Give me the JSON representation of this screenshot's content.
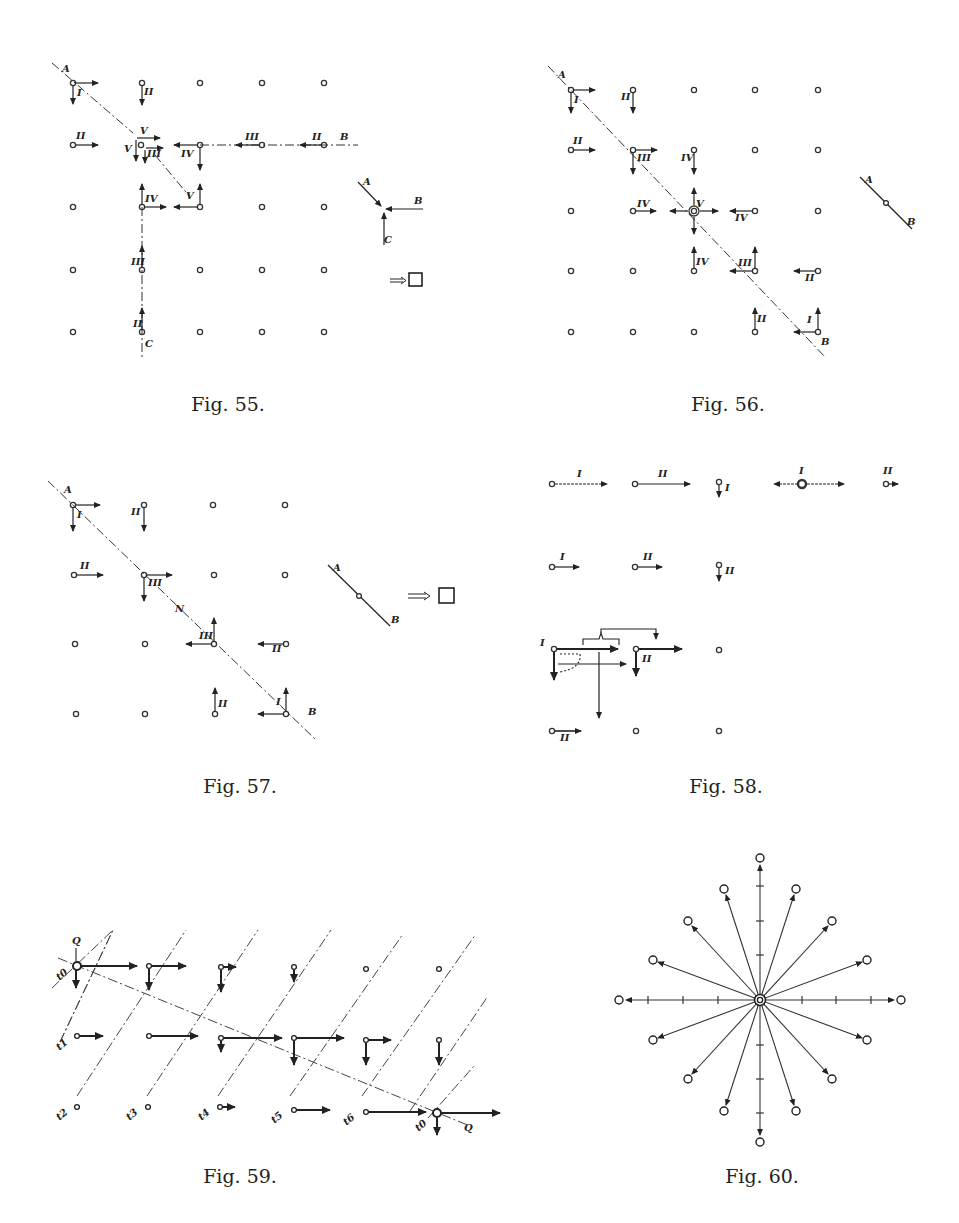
{
  "page": {
    "header_fragment": "",
    "figures": [
      {
        "id": "fig55",
        "caption": "Fig. 55.",
        "labels": [
          "A",
          "I",
          "II",
          "II",
          "V",
          "V",
          "III",
          "IV",
          "III",
          "II",
          "B",
          "IV",
          "V",
          "III",
          "II",
          "C",
          "A",
          "B",
          "C"
        ]
      },
      {
        "id": "fig56",
        "caption": "Fig. 56.",
        "labels": [
          "A",
          "I",
          "II",
          "II",
          "III",
          "IV",
          "IV",
          "V",
          "IV",
          "IV",
          "III",
          "II",
          "II",
          "I",
          "B",
          "A",
          "B"
        ]
      },
      {
        "id": "fig57",
        "caption": "Fig. 57.",
        "labels": [
          "A",
          "I",
          "II",
          "II",
          "III",
          "N",
          "III",
          "II",
          "II",
          "I",
          "B",
          "A",
          "B"
        ]
      },
      {
        "id": "fig58",
        "caption": "Fig. 58.",
        "labels": [
          "I",
          "II",
          "I",
          "I",
          "II",
          "I",
          "II",
          "II",
          "I",
          "II",
          "II"
        ]
      },
      {
        "id": "fig59",
        "caption": "Fig. 59.",
        "labels": [
          "Q",
          "t0",
          "t1",
          "t2",
          "t3",
          "t4",
          "t5",
          "t6",
          "t0",
          "Q"
        ]
      },
      {
        "id": "fig60",
        "caption": "Fig. 60.",
        "labels": []
      }
    ]
  }
}
